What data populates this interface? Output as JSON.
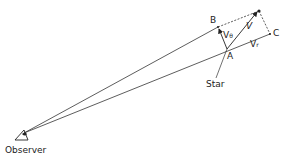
{
  "diagram": {
    "points": {
      "observer": {
        "label": "Observer"
      },
      "A": {
        "label": "A"
      },
      "B": {
        "label": "B"
      },
      "C": {
        "label": "C"
      },
      "star": {
        "label": "Star"
      }
    },
    "vectors": {
      "V": {
        "label": "V"
      },
      "Vtheta": {
        "label": "V",
        "sub": "θ"
      },
      "Vr": {
        "label": "V",
        "sub": "r"
      }
    }
  }
}
